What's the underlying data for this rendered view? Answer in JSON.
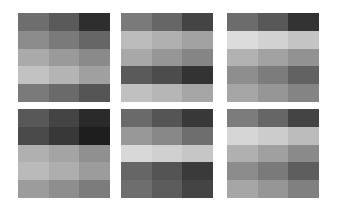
{
  "panels": [
    {
      "x": 18,
      "y": 13,
      "cells": [
        [
          "#6e6e6e",
          "#5a5a5a",
          "#2e2e2e"
        ],
        [
          "#8c8c8c",
          "#7a7a7a",
          "#666666"
        ],
        [
          "#aaaaaa",
          "#9a9a9a",
          "#8a8a8a"
        ],
        [
          "#c2c2c2",
          "#b4b4b4",
          "#a0a0a0"
        ],
        [
          "#7a7a7a",
          "#6a6a6a",
          "#555555"
        ]
      ]
    },
    {
      "x": 121,
      "y": 13,
      "cells": [
        [
          "#7a7a7a",
          "#666666",
          "#444444"
        ],
        [
          "#bcbcbc",
          "#b0b0b0",
          "#a2a2a2"
        ],
        [
          "#a8a8a8",
          "#969696",
          "#858585"
        ],
        [
          "#5a5a5a",
          "#4c4c4c",
          "#333333"
        ],
        [
          "#c0c0c0",
          "#b6b6b6",
          "#a6a6a6"
        ]
      ]
    },
    {
      "x": 227,
      "y": 13,
      "cells": [
        [
          "#6c6c6c",
          "#585858",
          "#333333"
        ],
        [
          "#dcdcdc",
          "#d2d2d2",
          "#c4c4c4"
        ],
        [
          "#b2b2b2",
          "#a2a2a2",
          "#929292"
        ],
        [
          "#8e8e8e",
          "#7c7c7c",
          "#626262"
        ],
        [
          "#a6a6a6",
          "#969696",
          "#848484"
        ]
      ]
    },
    {
      "x": 18,
      "y": 109,
      "cells": [
        [
          "#585858",
          "#444444",
          "#2a2a2a"
        ],
        [
          "#4a4a4a",
          "#383838",
          "#1e1e1e"
        ],
        [
          "#b0b0b0",
          "#a4a4a4",
          "#909090"
        ],
        [
          "#bababa",
          "#aeaeae",
          "#9c9c9c"
        ],
        [
          "#9c9c9c",
          "#8e8e8e",
          "#7c7c7c"
        ]
      ]
    },
    {
      "x": 121,
      "y": 109,
      "cells": [
        [
          "#6a6a6a",
          "#555555",
          "#383838"
        ],
        [
          "#989898",
          "#888888",
          "#6e6e6e"
        ],
        [
          "#d8d8d8",
          "#d0d0d0",
          "#c6c6c6"
        ],
        [
          "#666666",
          "#545454",
          "#3a3a3a"
        ],
        [
          "#6e6e6e",
          "#5c5c5c",
          "#444444"
        ]
      ]
    },
    {
      "x": 227,
      "y": 109,
      "cells": [
        [
          "#7c7c7c",
          "#666666",
          "#444444"
        ],
        [
          "#d6d6d6",
          "#cccccc",
          "#bcbcbc"
        ],
        [
          "#b0b0b0",
          "#a0a0a0",
          "#8a8a8a"
        ],
        [
          "#8c8c8c",
          "#7a7a7a",
          "#5e5e5e"
        ],
        [
          "#a6a6a6",
          "#969696",
          "#808080"
        ]
      ]
    }
  ]
}
